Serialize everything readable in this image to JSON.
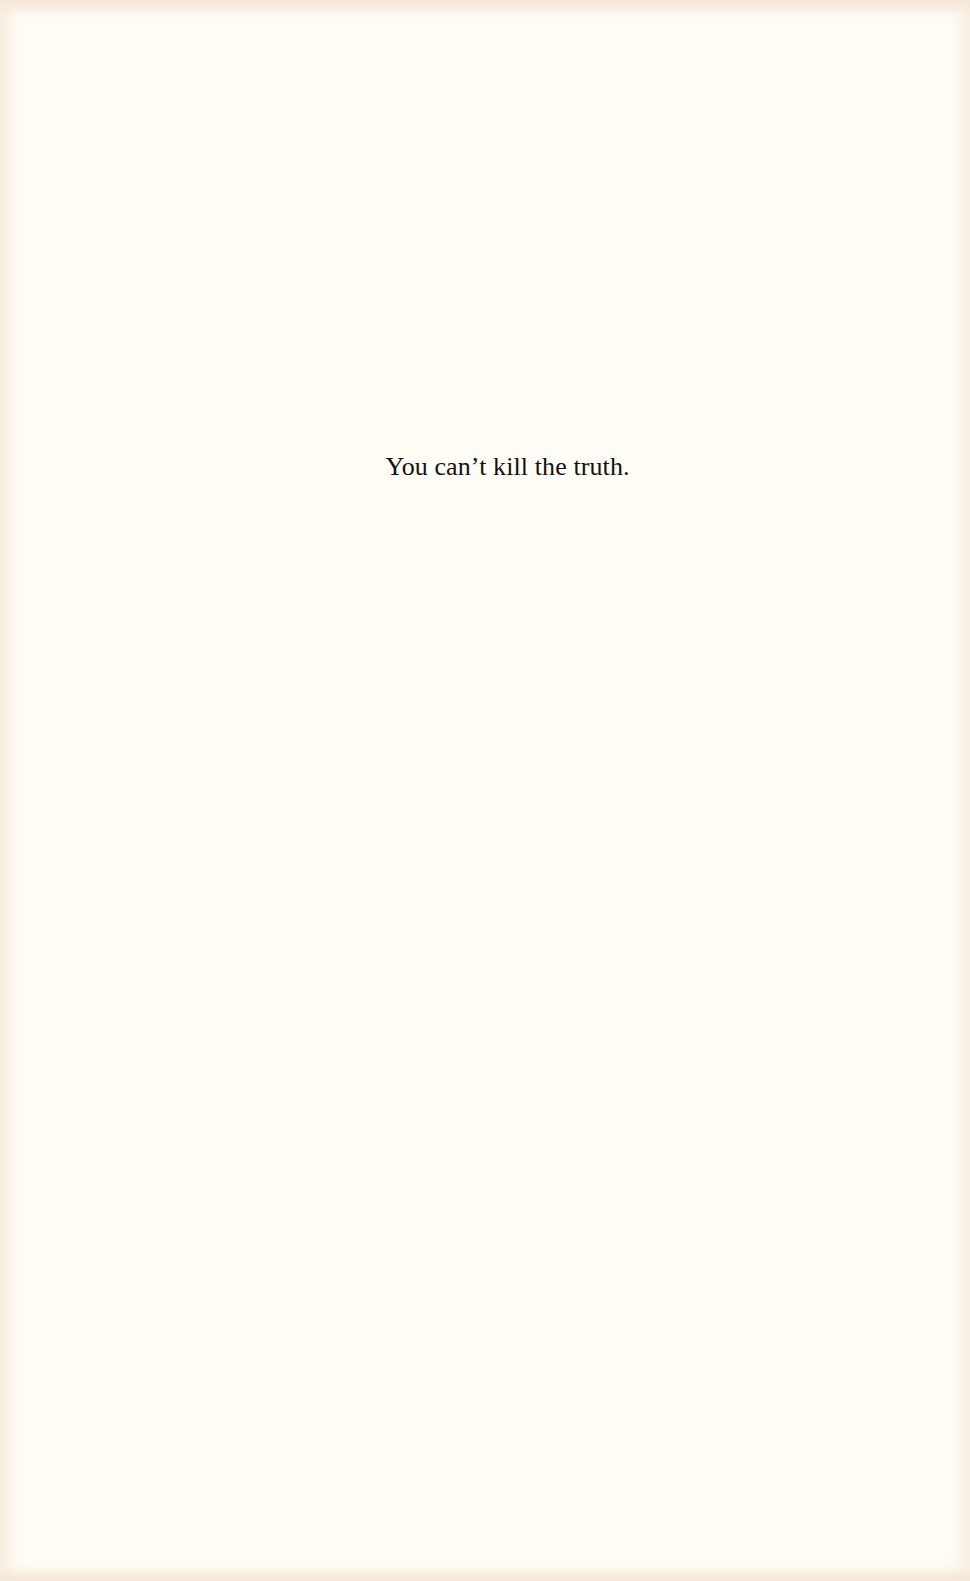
{
  "page": {
    "background_color": "#fffdf5",
    "text_color": "#111111",
    "epigraph": "You can’t kill the truth."
  }
}
